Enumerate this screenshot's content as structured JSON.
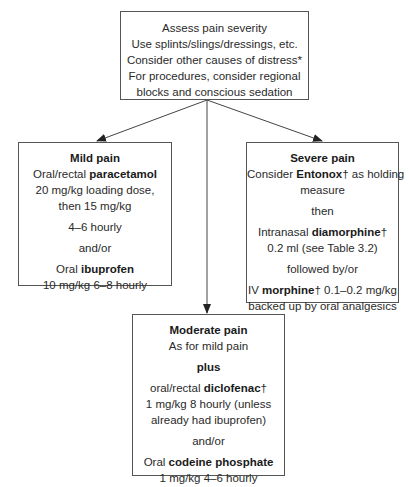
{
  "top": {
    "lines": [
      "Assess pain severity",
      "Use splints/slings/dressings, etc.",
      "Consider other causes of distress*",
      "For procedures, consider regional",
      "blocks and conscious sedation"
    ]
  },
  "mild": {
    "title": "Mild pain",
    "l1_pre": "Oral/rectal ",
    "l1_drug": "paracetamol",
    "l2": "20 mg/kg loading dose,",
    "l3": "then 15 mg/kg",
    "l4": "4–6 hourly",
    "l5": "and/or",
    "l6_pre": "Oral ",
    "l6_drug": "ibuprofen",
    "l7": "10 mg/kg 6–8 hourly"
  },
  "severe": {
    "title": "Severe pain",
    "l1_pre": "Consider ",
    "l1_drug": "Entonox",
    "l1_post": "† as holding",
    "l2": "measure",
    "l3": "then",
    "l4_pre": "Intranasal ",
    "l4_drug": "diamorphine",
    "l4_post": "†",
    "l5": "0.2 ml (see Table 3.2)",
    "l6": "followed by/or",
    "l7_pre": "IV ",
    "l7_drug": "morphine",
    "l7_post": "† 0.1–0.2 mg/kg",
    "l8": "backed up by oral analgesics"
  },
  "moderate": {
    "title": "Moderate pain",
    "l1": "As for mild pain",
    "l2": "plus",
    "l3_pre": "oral/rectal ",
    "l3_drug": "diclofenac",
    "l3_post": "†",
    "l4": "1 mg/kg 8 hourly (unless",
    "l5": "already had ibuprofen)",
    "l6": "and/or",
    "l7_pre": "Oral ",
    "l7_drug": "codeine phosphate",
    "l8": "1 mg/kg 4–6 hourly"
  }
}
